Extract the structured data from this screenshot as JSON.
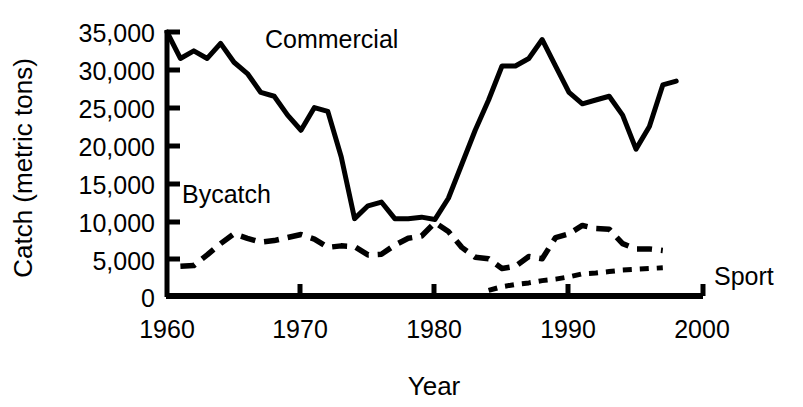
{
  "chart_data": {
    "type": "line",
    "title": "",
    "xlabel": "Year",
    "ylabel": "Catch (metric tons)",
    "xlim": [
      1960,
      2000
    ],
    "ylim": [
      0,
      35000
    ],
    "grid": false,
    "legend_position": "inline-annotations",
    "xticks": [
      "1960",
      "1970",
      "1980",
      "1990",
      "2000"
    ],
    "xtick_values": [
      1960,
      1970,
      1980,
      1990,
      2000
    ],
    "yticks": [
      "0",
      "5,000",
      "10,000",
      "15,000",
      "20,000",
      "25,000",
      "30,000",
      "35,000"
    ],
    "ytick_values": [
      0,
      5000,
      10000,
      15000,
      20000,
      25000,
      30000,
      35000
    ],
    "series": [
      {
        "name": "Commercial",
        "style": "solid",
        "color": "#000000",
        "x": [
          1960,
          1961,
          1962,
          1963,
          1964,
          1965,
          1966,
          1967,
          1968,
          1969,
          1970,
          1971,
          1972,
          1973,
          1974,
          1975,
          1976,
          1977,
          1978,
          1979,
          1980,
          1981,
          1982,
          1983,
          1984,
          1985,
          1986,
          1987,
          1988,
          1989,
          1990,
          1991,
          1992,
          1993,
          1994,
          1995,
          1996,
          1997,
          1998
        ],
        "values": [
          35000,
          31500,
          32500,
          31500,
          33500,
          31000,
          29500,
          27000,
          26500,
          24000,
          22000,
          25000,
          24500,
          18500,
          10300,
          12000,
          12500,
          10300,
          10300,
          10500,
          10200,
          13000,
          17500,
          22000,
          26000,
          30500,
          30500,
          31500,
          34000,
          30500,
          27000,
          25500,
          26000,
          26500,
          24000,
          19500,
          22500,
          28000,
          28500
        ]
      },
      {
        "name": "Bycatch",
        "style": "dashed",
        "color": "#000000",
        "x": [
          1961,
          1962,
          1963,
          1964,
          1965,
          1966,
          1967,
          1968,
          1969,
          1970,
          1971,
          1972,
          1973,
          1974,
          1975,
          1976,
          1977,
          1978,
          1979,
          1980,
          1981,
          1982,
          1983,
          1984,
          1985,
          1986,
          1987,
          1988,
          1989,
          1990,
          1991,
          1992,
          1993,
          1994,
          1995,
          1996,
          1997
        ],
        "values": [
          4000,
          4100,
          5500,
          7000,
          8300,
          7700,
          7200,
          7400,
          7800,
          8200,
          7600,
          6500,
          6700,
          6600,
          5500,
          5600,
          6800,
          7700,
          8000,
          9800,
          8600,
          6500,
          5200,
          5000,
          3700,
          4000,
          5300,
          5000,
          7800,
          8300,
          9400,
          9000,
          8900,
          7000,
          6300,
          6300,
          6100
        ]
      },
      {
        "name": "Sport",
        "style": "dotted",
        "color": "#000000",
        "x": [
          1984,
          1985,
          1986,
          1987,
          1988,
          1989,
          1990,
          1991,
          1992,
          1993,
          1994,
          1995,
          1996,
          1997
        ],
        "values": [
          800,
          1300,
          1600,
          1800,
          2100,
          2300,
          2600,
          3000,
          3100,
          3300,
          3500,
          3600,
          3700,
          3800
        ]
      }
    ],
    "annotations": [
      {
        "text": "Commercial",
        "x": 1975,
        "y": 32500
      },
      {
        "text": "Bycatch",
        "x": 1964.5,
        "y": 16500
      },
      {
        "text": "Sport",
        "x": 2001,
        "y": 3400
      }
    ]
  }
}
